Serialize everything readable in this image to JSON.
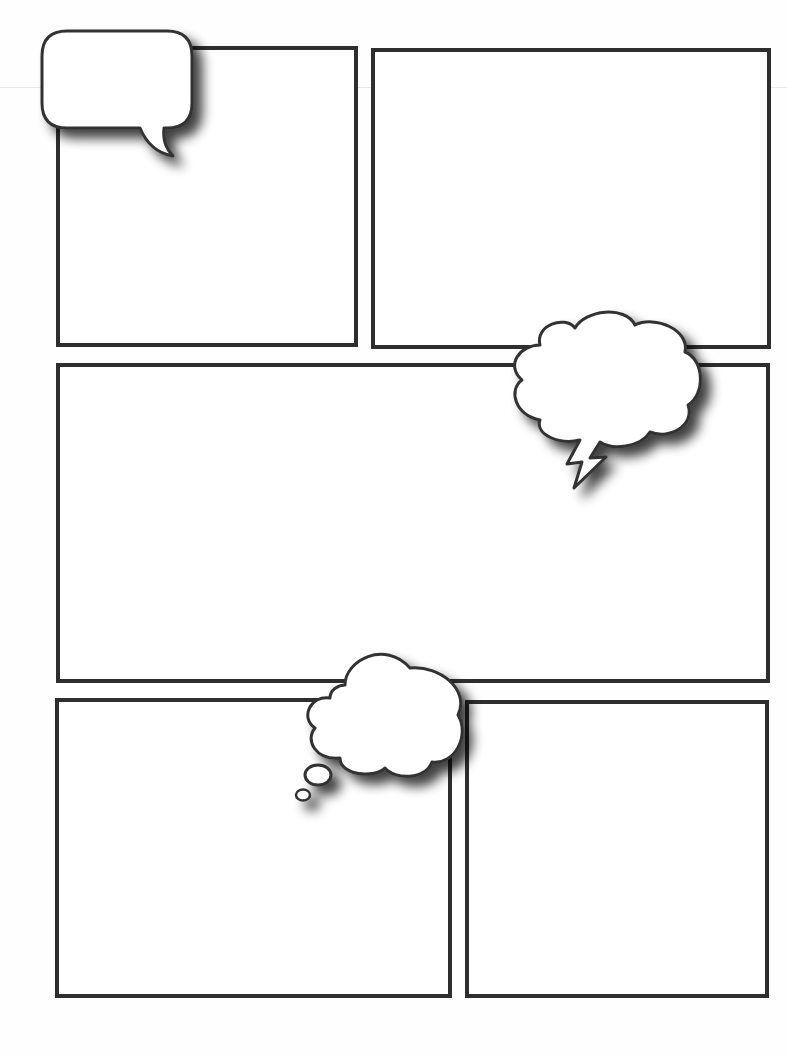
{
  "page": {
    "type": "blank comic book page template",
    "width": 787,
    "height": 1056,
    "background": "#fefefe",
    "border_color": "#2e2e2e",
    "border_width": 4
  },
  "panels": [
    {
      "id": "panel-1",
      "row": 1,
      "position": "top-left",
      "x": 56,
      "y": 46,
      "w": 302,
      "h": 301,
      "text": ""
    },
    {
      "id": "panel-2",
      "row": 1,
      "position": "top-right",
      "x": 371,
      "y": 48,
      "w": 400,
      "h": 301,
      "text": ""
    },
    {
      "id": "panel-3",
      "row": 2,
      "position": "middle-wide",
      "x": 56,
      "y": 363,
      "w": 714,
      "h": 320,
      "text": ""
    },
    {
      "id": "panel-4",
      "row": 3,
      "position": "bottom-left",
      "x": 55,
      "y": 698,
      "w": 397,
      "h": 300,
      "text": ""
    },
    {
      "id": "panel-5",
      "row": 3,
      "position": "bottom-right",
      "x": 465,
      "y": 700,
      "w": 304,
      "h": 298,
      "text": ""
    }
  ],
  "bubbles": [
    {
      "id": "speech-bubble",
      "kind": "speech",
      "shape": "rounded rectangle with curved tail",
      "text": ""
    },
    {
      "id": "shout-bubble",
      "kind": "shout",
      "shape": "cloud with lightning-bolt tail",
      "text": ""
    },
    {
      "id": "thought-bubble",
      "kind": "thought",
      "shape": "cloud with two trailing circles",
      "text": ""
    }
  ],
  "colors": {
    "outline": "#333333",
    "fill": "#ffffff",
    "shadow": "#000000"
  }
}
